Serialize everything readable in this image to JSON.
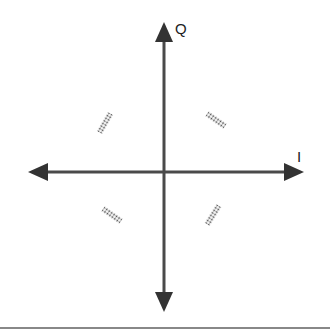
{
  "diagram": {
    "axes": {
      "horizontal_label": "I",
      "vertical_label": "Q",
      "color": "#4a4a4a"
    },
    "points": [
      {
        "quadrant": "Q2",
        "position": "upper-left",
        "orientation": "rising diagonal"
      },
      {
        "quadrant": "Q1",
        "position": "upper-right",
        "orientation": "falling diagonal"
      },
      {
        "quadrant": "Q3",
        "position": "lower-left",
        "orientation": "falling diagonal"
      },
      {
        "quadrant": "Q4",
        "position": "lower-right",
        "orientation": "rising diagonal"
      }
    ],
    "point_color": "#444444",
    "border_color": "#888888"
  }
}
